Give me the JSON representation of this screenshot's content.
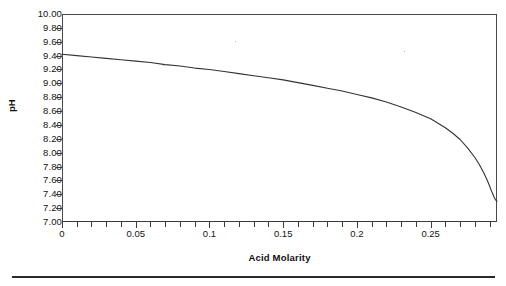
{
  "chart_data": {
    "type": "line",
    "title": "",
    "subtitle": "",
    "xlabel": "Acid Molarity",
    "ylabel": "pH",
    "xlim": [
      0,
      0.295
    ],
    "ylim": [
      7.0,
      10.0
    ],
    "grid": false,
    "legend": null,
    "x_tick_labels": [
      "0",
      "0.05",
      "0.1",
      "0.15",
      "0.2",
      "0.25"
    ],
    "x_tick_values": [
      0,
      0.05,
      0.1,
      0.15,
      0.2,
      0.25
    ],
    "x_minor_tick_step": 0.01,
    "y_tick_labels": [
      "10.00",
      "9.80",
      "9.60",
      "9.40",
      "9.20",
      "9.00",
      "8.80",
      "8.60",
      "8.40",
      "8.20",
      "8.00",
      "7.80",
      "7.60",
      "7.40",
      "7.20",
      "7.00"
    ],
    "y_tick_values": [
      10.0,
      9.8,
      9.6,
      9.4,
      9.2,
      9.0,
      8.8,
      8.6,
      8.4,
      8.2,
      8.0,
      7.8,
      7.6,
      7.4,
      7.2,
      7.0
    ],
    "series": [
      {
        "name": "pH vs Acid Molarity",
        "color": "#333333",
        "x": [
          0.0,
          0.01,
          0.02,
          0.03,
          0.04,
          0.05,
          0.06,
          0.07,
          0.08,
          0.09,
          0.1,
          0.11,
          0.12,
          0.13,
          0.14,
          0.15,
          0.16,
          0.17,
          0.18,
          0.19,
          0.2,
          0.21,
          0.22,
          0.23,
          0.24,
          0.25,
          0.26,
          0.265,
          0.27,
          0.275,
          0.28,
          0.283,
          0.286,
          0.288,
          0.29,
          0.291,
          0.292,
          0.293,
          0.294,
          0.295
        ],
        "y": [
          9.42,
          9.4,
          9.38,
          9.36,
          9.34,
          9.32,
          9.3,
          9.27,
          9.25,
          9.22,
          9.2,
          9.17,
          9.14,
          9.11,
          9.08,
          9.05,
          9.01,
          8.97,
          8.93,
          8.89,
          8.84,
          8.79,
          8.73,
          8.66,
          8.58,
          8.49,
          8.36,
          8.28,
          8.19,
          8.07,
          7.93,
          7.83,
          7.71,
          7.62,
          7.52,
          7.46,
          7.41,
          7.36,
          7.32,
          7.3
        ]
      }
    ]
  },
  "axes": {
    "x_title": "Acid Molarity",
    "y_title": "pH"
  }
}
